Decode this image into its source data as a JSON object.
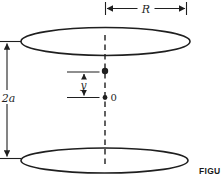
{
  "figure": {
    "caption": "FIGU",
    "labels": {
      "ring_radius": "R",
      "ring_separation": "2a",
      "axial_offset": "y",
      "origin": "0"
    },
    "colors": {
      "line": "#1f1f1f",
      "background": "#ffffff"
    }
  }
}
